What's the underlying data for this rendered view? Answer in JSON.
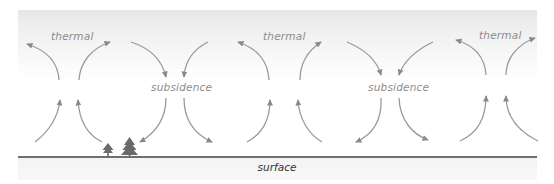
{
  "diagram": {
    "type": "atmospheric-convection-cells",
    "labels": {
      "thermal_1": "thermal",
      "thermal_2": "thermal",
      "thermal_3": "thermal",
      "subsidence_1": "subsidence",
      "subsidence_2": "subsidence",
      "surface": "surface"
    },
    "colors": {
      "arrow": "#8a8a8a",
      "label": "#8c8c8c",
      "surface_text": "#333333",
      "ground_line": "#6f6f6f",
      "tree": "#6a6a6a",
      "sky_top": "#e6e6e6"
    },
    "elements": {
      "thermal_columns": 3,
      "subsidence_columns": 2,
      "trees": 2
    }
  }
}
